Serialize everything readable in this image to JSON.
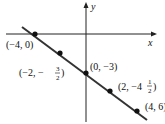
{
  "diagram": {
    "type": "coordinate-plane-line",
    "axes": {
      "x_label": "x",
      "y_label": "y"
    },
    "line": {
      "slope": "-3/4",
      "intercept": -3
    },
    "points": [
      {
        "label": "(−4, 0)",
        "x": -4,
        "y": 0
      },
      {
        "label_prefix": "(−2, −",
        "frac_num": "3",
        "frac_den": "2",
        "label_suffix": ")",
        "x": -2,
        "y": -1.5
      },
      {
        "label": "(0, −3)",
        "x": 0,
        "y": -3
      },
      {
        "label_prefix": "(2, −4",
        "frac_num": "1",
        "frac_den": "2",
        "label_suffix": ")",
        "x": 2,
        "y": -4.5
      },
      {
        "label": "(4, 6)",
        "x": 4,
        "y": -6
      }
    ]
  }
}
